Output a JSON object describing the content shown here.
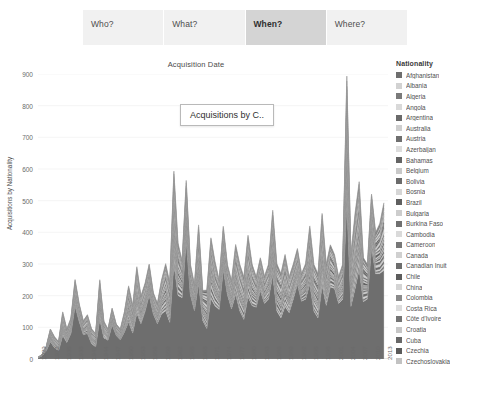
{
  "tabs": [
    {
      "label": "Who?",
      "selected": false
    },
    {
      "label": "What?",
      "selected": false
    },
    {
      "label": "When?",
      "selected": true
    },
    {
      "label": "Where?",
      "selected": false
    }
  ],
  "float_label": {
    "text": "Acquisitions by C.."
  },
  "legend": {
    "title": "Nationality",
    "items": [
      {
        "label": "Afghanistan",
        "color": "#6e6e6e"
      },
      {
        "label": "Albania",
        "color": "#d2d2d2"
      },
      {
        "label": "Algeria",
        "color": "#7a7a7a"
      },
      {
        "label": "Angola",
        "color": "#d9d9d9"
      },
      {
        "label": "Argentina",
        "color": "#6a6a6a"
      },
      {
        "label": "Australia",
        "color": "#cfcfcf"
      },
      {
        "label": "Austria",
        "color": "#6f6f6f"
      },
      {
        "label": "Azerbaijan",
        "color": "#dddddd"
      },
      {
        "label": "Bahamas",
        "color": "#646464"
      },
      {
        "label": "Belgium",
        "color": "#c9c9c9"
      },
      {
        "label": "Bolivia",
        "color": "#6b6b6b"
      },
      {
        "label": "Bosnia",
        "color": "#d6d6d6"
      },
      {
        "label": "Brazil",
        "color": "#5f5f5f"
      },
      {
        "label": "Bulgaria",
        "color": "#cdcdcd"
      },
      {
        "label": "Burkina Faso",
        "color": "#707070"
      },
      {
        "label": "Cambodia",
        "color": "#dadada"
      },
      {
        "label": "Cameroon",
        "color": "#777777"
      },
      {
        "label": "Canada",
        "color": "#d0d0d0"
      },
      {
        "label": "Canadian Inuit",
        "color": "#6d6d6d"
      },
      {
        "label": "Chile",
        "color": "#5c5c5c"
      },
      {
        "label": "China",
        "color": "#d4d4d4"
      },
      {
        "label": "Colombia",
        "color": "#8a8a8a"
      },
      {
        "label": "Costa Rica",
        "color": "#dcdcdc"
      },
      {
        "label": "Côte d'Ivoire",
        "color": "#747474"
      },
      {
        "label": "Croatia",
        "color": "#c7c7c7"
      },
      {
        "label": "Cuba",
        "color": "#686868"
      },
      {
        "label": "Czechia",
        "color": "#5a5a5a"
      },
      {
        "label": "Czechoslovakia",
        "color": "#c2c2c2"
      }
    ]
  },
  "chart_data": {
    "type": "area",
    "stacked": true,
    "title": "Acquisition Date",
    "xlabel": "",
    "ylabel": "Acquisitions by Nationality",
    "ylim": [
      0,
      900
    ],
    "yticks": [
      0,
      100,
      200,
      300,
      400,
      500,
      600,
      700,
      800,
      900
    ],
    "grid": true,
    "legend_position": "right",
    "xlim": [
      1929,
      2014
    ],
    "xticks": [
      1929,
      1932,
      1935,
      1938,
      1941,
      1944,
      1947,
      1950,
      1953,
      1956,
      1959,
      1962,
      1965,
      1968,
      1971,
      1974,
      1977,
      1980,
      1983,
      1986,
      1989,
      1992,
      1995,
      1998,
      2001,
      2004,
      2007,
      2010,
      2013
    ],
    "x": [
      1929,
      1930,
      1931,
      1932,
      1933,
      1934,
      1935,
      1936,
      1937,
      1938,
      1939,
      1940,
      1941,
      1942,
      1943,
      1944,
      1945,
      1946,
      1947,
      1948,
      1949,
      1950,
      1951,
      1952,
      1953,
      1954,
      1955,
      1956,
      1957,
      1958,
      1959,
      1960,
      1961,
      1962,
      1963,
      1964,
      1965,
      1966,
      1967,
      1968,
      1969,
      1970,
      1971,
      1972,
      1973,
      1974,
      1975,
      1976,
      1977,
      1978,
      1979,
      1980,
      1981,
      1982,
      1983,
      1984,
      1985,
      1986,
      1987,
      1988,
      1989,
      1990,
      1991,
      1992,
      1993,
      1994,
      1995,
      1996,
      1997,
      1998,
      1999,
      2000,
      2001,
      2002,
      2003,
      2004,
      2005,
      2006,
      2007,
      2008,
      2009,
      2010,
      2011,
      2012,
      2013
    ],
    "total": [
      5,
      15,
      40,
      95,
      70,
      55,
      150,
      95,
      130,
      250,
      175,
      120,
      140,
      95,
      80,
      250,
      120,
      95,
      160,
      110,
      95,
      150,
      230,
      170,
      290,
      200,
      240,
      300,
      210,
      175,
      250,
      300,
      240,
      600,
      360,
      310,
      560,
      300,
      240,
      420,
      240,
      200,
      380,
      300,
      250,
      420,
      300,
      250,
      360,
      300,
      260,
      390,
      300,
      260,
      320,
      260,
      300,
      470,
      300,
      270,
      330,
      260,
      300,
      350,
      270,
      300,
      420,
      300,
      270,
      460,
      300,
      360,
      330,
      260,
      300,
      885,
      330,
      460,
      560,
      320,
      300,
      520,
      400,
      430,
      500
    ],
    "series_note": "28 nationality bands stacked; the largest dark band at the base is the dominant nationality",
    "annotations": [
      {
        "text": "Acquisitions by C..",
        "x": 1965,
        "y": 760
      }
    ]
  }
}
